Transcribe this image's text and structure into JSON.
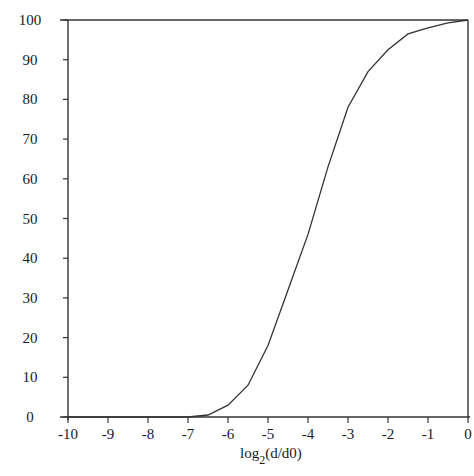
{
  "chart_data": {
    "type": "line",
    "title": "",
    "xlabel": "log2(d/d0)",
    "xlabel_base": "log",
    "xlabel_sub": "2",
    "xlabel_rest": "(d/d0)",
    "ylabel": "",
    "xlim": [
      -10,
      0
    ],
    "ylim": [
      0,
      100
    ],
    "grid": false,
    "legend": null,
    "x_ticks": [
      -10,
      -9,
      -8,
      -7,
      -6,
      -5,
      -4,
      -3,
      -2,
      -1,
      0
    ],
    "y_ticks": [
      0,
      10,
      20,
      30,
      40,
      50,
      60,
      70,
      80,
      90,
      100
    ],
    "series": [
      {
        "name": "cumulative",
        "x": [
          -10,
          -9,
          -8,
          -7,
          -6.5,
          -6,
          -5.5,
          -5,
          -4.5,
          -4,
          -3.5,
          -3,
          -2.5,
          -2,
          -1.5,
          -1,
          -0.5,
          0
        ],
        "y": [
          0,
          0,
          0,
          0,
          0.5,
          3,
          8,
          18,
          32,
          46,
          63,
          78,
          87,
          92.5,
          96.5,
          98,
          99.3,
          100
        ]
      }
    ]
  },
  "colors": {
    "line": "#333333",
    "axis": "#333333",
    "background": "#ffffff"
  }
}
